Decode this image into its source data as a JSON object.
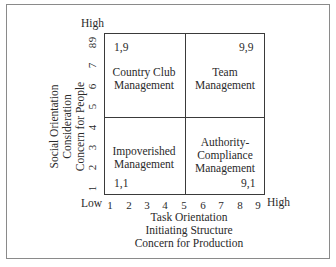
{
  "diagram": {
    "type": "managerial-grid",
    "y_axis": {
      "high_label": "High",
      "low_label": "Low",
      "ticks": [
        "1",
        "2",
        "3",
        "4",
        "5",
        "6",
        "7",
        "8",
        "9"
      ],
      "title_lines": [
        "Social Orientation",
        "Consideration",
        "Concern for People"
      ]
    },
    "x_axis": {
      "high_label": "High",
      "ticks": [
        "1",
        "2",
        "3",
        "4",
        "5",
        "6",
        "7",
        "8",
        "9"
      ],
      "title_lines": [
        "Task Orientation",
        "Initiating Structure",
        "Concern for Production"
      ]
    },
    "quadrants": {
      "top_left": {
        "coord": "1,9",
        "label_lines": [
          "Country Club",
          "Management"
        ]
      },
      "top_right": {
        "coord": "9,9",
        "label_lines": [
          "Team",
          "Management"
        ]
      },
      "bottom_left": {
        "coord": "1,1",
        "label_lines": [
          "Impoverished",
          "Management"
        ]
      },
      "bottom_right": {
        "coord": "9,1",
        "label_lines": [
          "Authority-",
          "Compliance",
          "Management"
        ]
      }
    }
  }
}
